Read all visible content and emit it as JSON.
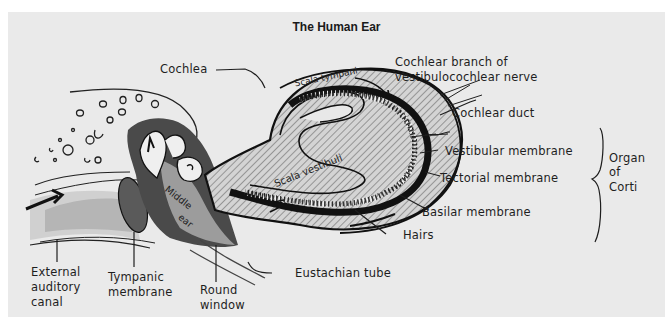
{
  "figure": {
    "title": "The Human Ear",
    "background_color": "#eaeaea",
    "ink_color": "#1e1e1e"
  },
  "labels": {
    "cochlea": "Cochlea",
    "cochlear_nerve_line1": "Cochlear branch of",
    "cochlear_nerve_line2": "vestibulocochlear nerve",
    "cochlear_duct": "Cochlear duct",
    "vestibular_membrane": "Vestibular membrane",
    "tectorial_membrane": "Tectorial membrane",
    "basilar_membrane": "Basilar membrane",
    "hairs": "Hairs",
    "organ_of_corti_line1": "Organ",
    "organ_of_corti_line2": "of",
    "organ_of_corti_line3": "Corti",
    "external_canal_line1": "External",
    "external_canal_line2": "auditory",
    "external_canal_line3": "canal",
    "tympanic_line1": "Tympanic",
    "tympanic_line2": "membrane",
    "round_window_line1": "Round",
    "round_window_line2": "window",
    "eustachian_tube": "Eustachian tube"
  },
  "inner_labels": {
    "scala_tympani": "Scala tympani",
    "scala_vestibuli": "Scala vestibuli",
    "middle_ear_line1": "Middle",
    "middle_ear_line2": "ear"
  }
}
